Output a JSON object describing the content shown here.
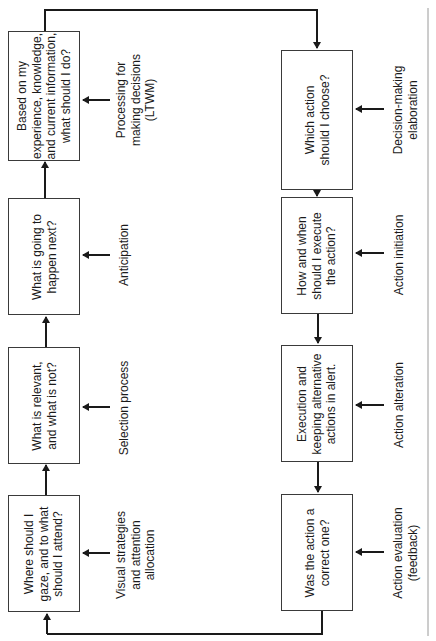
{
  "diagram": {
    "orientation": "rotated-90-ccw",
    "left_column": {
      "boxes": [
        {
          "id": "decision-processing",
          "text": "Based on my\nexperience, knowledge,\nand current information,\nwhat should I do?"
        },
        {
          "id": "anticipation",
          "text": "What is going to\nhappen next?"
        },
        {
          "id": "selection",
          "text": "What is relevant,\nand what is not?"
        },
        {
          "id": "visual-strategies",
          "text": "Where should I\ngaze, and to what\nshould I attend?"
        }
      ],
      "labels": [
        {
          "text": "Processing for\nmaking decisions\n(LTWM)"
        },
        {
          "text": "Anticipation"
        },
        {
          "text": "Selection process"
        },
        {
          "text": "Visual strategies\nand attention\nallocation"
        }
      ]
    },
    "right_column": {
      "boxes": [
        {
          "id": "choose-action",
          "text": "Which action\nshould I choose?"
        },
        {
          "id": "execute-action",
          "text": "How and when\nshould I execute\nthe action?"
        },
        {
          "id": "execution-alert",
          "text": "Execution and\nkeeping alternative\nactions in alert."
        },
        {
          "id": "evaluation",
          "text": "Was the action a\ncorrect one?"
        }
      ],
      "labels": [
        {
          "text": "Decision-making\nelaboration"
        },
        {
          "text": "Action initiation"
        },
        {
          "text": "Action alteration"
        },
        {
          "text": "Action evaluation\n(feedback)"
        }
      ]
    },
    "colors": {
      "line": "#1a1a1a",
      "box_border": "#3a3a3a",
      "frame_line": "#9a9a9a",
      "background": "#ffffff"
    }
  }
}
